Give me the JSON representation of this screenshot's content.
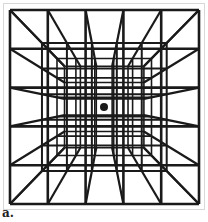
{
  "figure": {
    "caption": "a.",
    "stroke_color": "#1a1a1a",
    "dot_color": "#1a1a1a",
    "outer_box": {
      "x0": 10,
      "y0": 10,
      "x1": 199,
      "y1": 204
    },
    "vanishing_point": {
      "x": 104,
      "y": 107
    },
    "divisions": 5,
    "depth_scales": [
      1.0,
      0.66,
      0.5,
      0.42
    ]
  }
}
